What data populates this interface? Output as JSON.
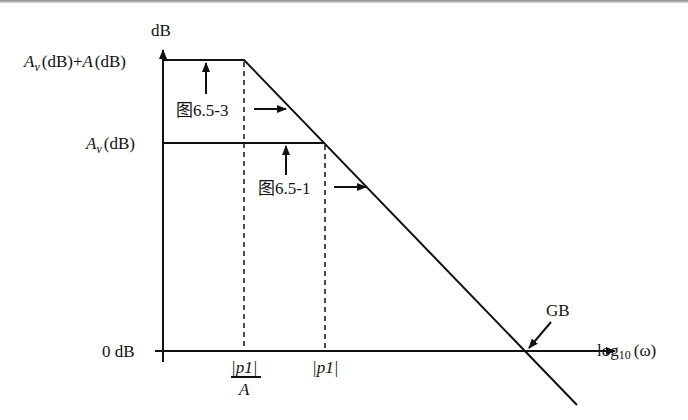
{
  "diagram": {
    "y_axis_label": "dB",
    "x_axis_label": "log10 (ω)",
    "levels": {
      "top": "Av (dB) + A (dB)",
      "top_parts": {
        "a": "A",
        "sub": "v",
        "rest": "(dB)+",
        "a2": "A",
        "rest2": "(dB)"
      },
      "mid_parts": {
        "a": "A",
        "sub": "v",
        "rest": "(dB)"
      },
      "zero": "0 dB"
    },
    "x_ticks": {
      "p1_over_A_num": "|p1|",
      "p1_over_A_den": "A",
      "p1": "|p1|"
    },
    "annotations": {
      "fig_653": "图6.5-3",
      "fig_651": "图6.5-1",
      "gb": "GB"
    },
    "log_label": {
      "log": "log",
      "sub": "10",
      "rest": "(ω)"
    }
  }
}
